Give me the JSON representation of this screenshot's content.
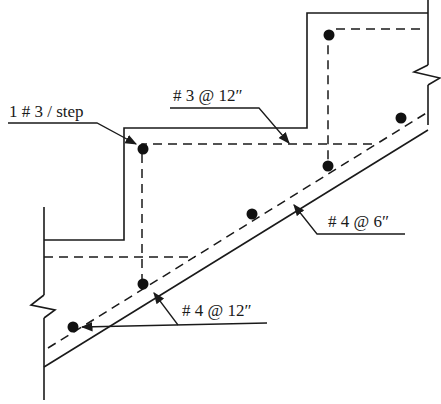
{
  "diagram": {
    "type": "stair reinforcement detail",
    "labels": {
      "step_bar": "1 # 3 / step",
      "transverse": "# 3 @ 12″",
      "main_bottom": "# 4 @ 6″",
      "landing_bar": "# 4 @ 12″"
    },
    "colors": {
      "ink": "#1a1a1a",
      "background": "#ffffff"
    }
  }
}
